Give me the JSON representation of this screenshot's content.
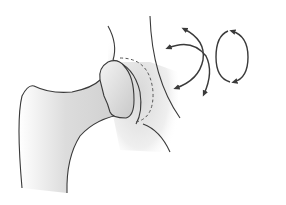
{
  "figure": {
    "width": 286,
    "height": 205,
    "colors": {
      "background": "#ffffff",
      "outline": "#3a3a3a",
      "shade": "#d4d4d4",
      "dashed": "#555555"
    },
    "elements": [
      {
        "name": "pelvis-outline",
        "description": "acetabulum / pelvis curved outline"
      },
      {
        "name": "femur",
        "description": "proximal femur with greater trochanter and shaft"
      },
      {
        "name": "femoral-head",
        "description": "femoral head inside socket"
      },
      {
        "name": "acetabulum-dashed-line",
        "description": "dashed line indicating hidden socket rim"
      },
      {
        "name": "rotation-arrows-crossed",
        "description": "two curved double-headed arrows (flexion/rotation)"
      },
      {
        "name": "rotation-arrow-circular",
        "description": "oval circular double-headed arrow (circumduction)"
      }
    ]
  }
}
